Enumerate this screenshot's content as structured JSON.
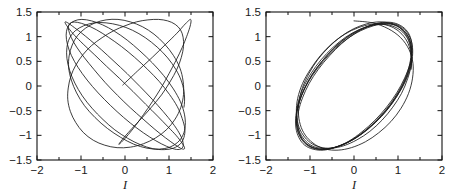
{
  "figure": {
    "background_color": "#ffffff",
    "curve_color": "#1a1a1a",
    "axis_color": "#111111",
    "panel_count": 2
  },
  "chart_data": [
    {
      "type": "line",
      "title": "",
      "subtitle": "",
      "panel": "left",
      "xlabel": "I",
      "ylabel": "",
      "xlim": [
        -2,
        2
      ],
      "ylim": [
        -1.5,
        1.5
      ],
      "xticks": [
        -2,
        -1,
        0,
        1,
        2
      ],
      "xticklabels": [
        "-2",
        "-1",
        "0",
        "1",
        "2"
      ],
      "yticks": [
        -1.5,
        -1,
        -0.5,
        0,
        0.5,
        1,
        1.5
      ],
      "yticklabels": [
        "-1.5",
        "-1",
        "-0.5",
        "0",
        "0.5",
        "1",
        "1.5"
      ],
      "minor_xticks": [
        -1.5,
        -0.5,
        0.5,
        1.5
      ],
      "minor_yticks": [],
      "grid": false,
      "legend": null,
      "legend_position": "none",
      "annotations": [],
      "description": "Quasi-periodic trajectory: a broad right-hand lobe crossed by a narrow elongated pencil of near-straight strands running from lower-left cusp to upper-right, plus a thin ellipse across the top.",
      "series": [
        {
          "name": "trajectory",
          "x": [
            -0.05,
            0.28,
            0.62,
            0.93,
            1.18,
            1.34,
            1.44,
            1.49,
            1.5,
            1.47,
            1.4,
            1.3,
            1.16,
            1.0,
            0.82,
            0.62,
            0.42,
            0.24,
            0.08,
            -0.04,
            -0.12,
            -0.14,
            -0.1,
            0.0,
            0.16,
            0.37,
            0.6,
            0.83,
            1.02,
            1.18,
            1.28,
            1.33,
            1.32,
            1.26,
            1.14,
            0.97,
            0.76,
            0.52,
            0.26,
            0.0,
            -0.26,
            -0.52,
            -0.76,
            -0.96,
            -1.12,
            -1.23,
            -1.29,
            -1.3,
            -1.24,
            -1.12,
            -0.95,
            -0.72,
            -0.46,
            -0.18,
            0.12,
            0.42,
            0.7,
            0.95,
            1.14,
            1.27,
            1.33,
            1.32,
            1.25,
            1.1,
            0.9,
            0.66,
            0.4,
            0.12,
            -0.16,
            -0.43,
            -0.68,
            -0.9,
            -1.08,
            -1.2,
            -1.27,
            -1.28,
            -1.22,
            -1.1,
            -0.92,
            -0.68,
            -0.4,
            -0.1,
            0.2,
            0.5,
            0.78,
            1.02,
            1.2,
            1.32,
            1.37,
            1.35,
            1.26,
            1.1,
            0.88,
            0.62,
            0.34,
            0.05,
            -0.24,
            -0.51,
            -0.76,
            -0.98,
            -1.15,
            -1.27,
            -1.33,
            -1.33,
            -1.27,
            -1.15,
            -0.97,
            -0.74,
            -0.47,
            -0.18,
            0.12,
            0.42,
            0.7,
            0.94,
            1.13,
            1.26,
            1.32,
            1.31,
            1.23,
            1.08,
            0.87,
            0.62,
            0.34,
            0.05,
            -0.25,
            -0.53,
            -0.79,
            -1.01,
            -1.19,
            -1.3,
            -1.36,
            -1.35,
            -1.28,
            -1.15,
            -0.95,
            -0.7,
            -0.42,
            -0.12,
            0.18,
            0.47,
            0.74,
            0.98,
            1.17,
            1.29,
            1.35,
            1.34,
            1.26,
            1.12,
            0.92,
            0.68,
            0.41,
            0.12,
            -0.17,
            -0.45,
            -0.7,
            -0.92,
            -1.1,
            -1.22,
            -1.28,
            -1.28,
            -1.21,
            -1.08,
            -0.89,
            -0.65,
            -0.38,
            -0.08,
            0.22,
            0.51,
            0.78,
            1.01,
            1.19,
            1.3,
            1.36,
            1.34,
            1.26,
            1.1,
            0.89,
            0.63,
            0.35,
            0.06,
            -0.23,
            -0.5,
            -0.75,
            -0.97,
            -1.14,
            -1.26,
            -1.32,
            -1.32,
            -1.26,
            -1.13,
            -0.94,
            -0.7,
            -0.43,
            -0.13,
            0.17,
            0.46,
            0.73,
            0.97,
            1.16,
            1.29,
            1.35,
            1.34,
            1.26,
            1.12,
            0.91,
            0.66,
            0.38,
            0.09
          ],
          "y": [
            0.02,
            0.3,
            0.58,
            0.85,
            1.07,
            1.23,
            1.32,
            1.35,
            1.3,
            1.18,
            1.0,
            0.78,
            0.52,
            0.25,
            -0.04,
            -0.32,
            -0.58,
            -0.8,
            -0.98,
            -1.1,
            -1.17,
            -1.18,
            -1.13,
            -1.02,
            -0.86,
            -0.66,
            -0.43,
            -0.18,
            0.08,
            0.34,
            0.58,
            0.8,
            0.99,
            1.14,
            1.25,
            1.32,
            1.35,
            1.34,
            1.3,
            1.22,
            1.12,
            0.98,
            0.82,
            0.63,
            0.42,
            0.2,
            -0.04,
            -0.28,
            -0.52,
            -0.74,
            -0.94,
            -1.1,
            -1.2,
            -1.25,
            -1.24,
            -1.17,
            -1.05,
            -0.88,
            -0.67,
            -0.43,
            -0.17,
            0.1,
            0.36,
            0.62,
            0.85,
            1.05,
            1.2,
            1.3,
            1.35,
            1.34,
            1.28,
            1.17,
            1.02,
            0.83,
            0.61,
            0.37,
            0.12,
            -0.14,
            -0.4,
            -0.64,
            -0.86,
            -1.04,
            -1.18,
            -1.26,
            -1.28,
            -1.24,
            -1.14,
            -0.99,
            -0.8,
            -0.57,
            -0.32,
            -0.06,
            0.21,
            0.47,
            0.71,
            0.93,
            1.11,
            1.24,
            1.32,
            1.35,
            1.32,
            1.24,
            1.11,
            0.94,
            0.73,
            0.5,
            0.25,
            -0.01,
            -0.27,
            -0.52,
            -0.75,
            -0.95,
            -1.11,
            -1.22,
            -1.28,
            -1.28,
            -1.22,
            -1.11,
            -0.95,
            -0.75,
            -0.52,
            -0.27,
            -0.01,
            0.25,
            0.5,
            0.73,
            0.93,
            1.09,
            1.21,
            1.28,
            1.3,
            1.26,
            1.17,
            1.03,
            0.85,
            0.64,
            0.4,
            0.15,
            -0.11,
            -0.37,
            -0.61,
            -0.83,
            -1.01,
            -1.15,
            -1.24,
            -1.28,
            -1.26,
            -1.18,
            -1.05,
            -0.88,
            -0.67,
            -0.44,
            -0.19,
            0.07,
            0.33,
            0.57,
            0.79,
            0.98,
            1.13,
            1.23,
            1.29,
            1.29,
            1.24,
            1.14,
            0.99,
            0.8,
            0.58,
            0.34,
            0.09,
            -0.17,
            -0.42,
            -0.66,
            -0.87,
            -1.04,
            -1.17,
            -1.26,
            -1.29,
            -1.27,
            -1.19,
            -1.06,
            -0.89,
            -0.68,
            -0.45,
            -0.2,
            0.06,
            0.32,
            0.56,
            0.78,
            0.97,
            1.12,
            1.22,
            1.28,
            1.28,
            1.23,
            1.13,
            0.98,
            0.79,
            0.57,
            0.33,
            0.08,
            -0.18,
            -0.43,
            -0.66
          ]
        }
      ]
    },
    {
      "type": "line",
      "title": "",
      "subtitle": "",
      "panel": "right",
      "xlabel": "I",
      "ylabel": "",
      "xlim": [
        -2,
        2
      ],
      "ylim": [
        -1.5,
        1.5
      ],
      "xticks": [
        -2,
        -1,
        0,
        1,
        2
      ],
      "xticklabels": [
        "-2",
        "-1",
        "0",
        "1",
        "2"
      ],
      "yticks": [
        -1.5,
        -1,
        -0.5,
        0,
        0.5,
        1,
        1.5
      ],
      "yticklabels": [
        "-1.5",
        "-1",
        "-0.5",
        "0",
        "0.5",
        "1",
        "1.5"
      ],
      "minor_xticks": [
        -1.5,
        -0.5,
        0.5,
        1.5
      ],
      "minor_yticks": [],
      "grid": false,
      "legend": null,
      "legend_position": "none",
      "annotations": [],
      "description": "Quasi-periodic trajectory forming a bundle of nested near-circular loops of radius about 1.3 centred near the origin, with a thin tilted ellipse overlaying the upper-left region and strands converging near (0, 1.35).",
      "series": [
        {
          "name": "trajectory",
          "x": [
            0.0,
            0.42,
            0.78,
            1.06,
            1.25,
            1.34,
            1.33,
            1.24,
            1.07,
            0.84,
            0.56,
            0.26,
            -0.06,
            -0.36,
            -0.64,
            -0.88,
            -1.07,
            -1.2,
            -1.26,
            -1.25,
            -1.17,
            -1.02,
            -0.82,
            -0.57,
            -0.3,
            -0.01,
            0.29,
            0.57,
            0.83,
            1.04,
            1.19,
            1.28,
            1.29,
            1.23,
            1.1,
            0.91,
            0.67,
            0.4,
            0.11,
            -0.19,
            -0.47,
            -0.73,
            -0.95,
            -1.12,
            -1.23,
            -1.28,
            -1.26,
            -1.17,
            -1.02,
            -0.81,
            -0.56,
            -0.28,
            0.01,
            0.3,
            0.58,
            0.84,
            1.05,
            1.21,
            1.3,
            1.32,
            1.27,
            1.15,
            0.97,
            0.74,
            0.47,
            0.18,
            -0.12,
            -0.42,
            -0.69,
            -0.93,
            -1.12,
            -1.25,
            -1.32,
            -1.32,
            -1.25,
            -1.12,
            -0.93,
            -0.69,
            -0.42,
            -0.13,
            0.17,
            0.46,
            0.73,
            0.96,
            1.14,
            1.26,
            1.31,
            1.29,
            1.2,
            1.04,
            0.83,
            0.57,
            0.29,
            -0.01,
            -0.31,
            -0.59,
            -0.84,
            -1.05,
            -1.2,
            -1.29,
            -1.31,
            -1.26,
            -1.14,
            -0.96,
            -0.73,
            -0.47,
            -0.18,
            0.12,
            0.42,
            0.7,
            0.95,
            1.14,
            1.27,
            1.33,
            1.32,
            1.24,
            1.09,
            0.88,
            0.63,
            0.34,
            0.04,
            -0.26,
            -0.55,
            -0.8,
            -1.02,
            -1.18,
            -1.28,
            -1.31,
            -1.26,
            -1.14,
            -0.95,
            -0.71,
            -0.44,
            -0.15,
            0.15,
            0.44,
            0.71,
            0.94,
            1.12,
            1.25,
            1.31,
            1.3,
            1.22,
            1.07,
            0.87,
            0.62,
            0.34,
            0.05,
            -0.25,
            -0.53,
            -0.78,
            -1.0,
            -1.16,
            -1.27,
            -1.31,
            -1.27,
            -1.16,
            -0.98,
            -0.75,
            -0.48,
            -0.19,
            0.11,
            0.41,
            0.68,
            0.92,
            1.11,
            1.24,
            1.3,
            1.3,
            1.22,
            1.08,
            0.88,
            0.64,
            0.36,
            0.07,
            -0.23,
            -0.51,
            -0.77,
            -0.99,
            -1.16,
            -1.27,
            -1.31,
            -1.28,
            -1.17,
            -0.99,
            -0.76,
            -0.5,
            -0.21,
            0.09,
            0.39,
            0.66,
            0.9,
            1.09,
            1.23,
            1.3,
            1.3,
            1.23,
            1.09,
            0.9,
            0.66,
            0.39,
            0.09
          ],
          "y": [
            1.32,
            1.28,
            1.16,
            0.98,
            0.74,
            0.46,
            0.16,
            -0.15,
            -0.45,
            -0.72,
            -0.95,
            -1.13,
            -1.25,
            -1.3,
            -1.28,
            -1.19,
            -1.04,
            -0.84,
            -0.59,
            -0.32,
            -0.03,
            0.26,
            0.54,
            0.79,
            1.0,
            1.16,
            1.26,
            1.3,
            1.27,
            1.18,
            1.03,
            0.83,
            0.58,
            0.32,
            0.03,
            -0.26,
            -0.54,
            -0.79,
            -1.0,
            -1.16,
            -1.25,
            -1.28,
            -1.24,
            -1.14,
            -0.97,
            -0.76,
            -0.51,
            -0.24,
            0.05,
            0.34,
            0.61,
            0.86,
            1.06,
            1.2,
            1.28,
            1.29,
            1.23,
            1.11,
            0.93,
            0.7,
            0.44,
            0.16,
            -0.14,
            -0.43,
            -0.7,
            -0.93,
            -1.12,
            -1.24,
            -1.3,
            -1.28,
            -1.2,
            -1.05,
            -0.85,
            -0.6,
            -0.33,
            -0.04,
            0.26,
            0.54,
            0.79,
            1.0,
            1.15,
            1.24,
            1.27,
            1.23,
            1.12,
            0.95,
            0.73,
            0.48,
            0.2,
            -0.09,
            -0.38,
            -0.65,
            -0.89,
            -1.08,
            -1.21,
            -1.28,
            -1.28,
            -1.21,
            -1.07,
            -0.88,
            -0.64,
            -0.37,
            -0.08,
            0.22,
            0.5,
            0.76,
            0.98,
            1.14,
            1.24,
            1.28,
            1.25,
            1.15,
            0.99,
            0.78,
            0.53,
            0.25,
            -0.04,
            -0.33,
            -0.61,
            -0.85,
            -1.05,
            -1.19,
            -1.27,
            -1.28,
            -1.21,
            -1.08,
            -0.89,
            -0.65,
            -0.38,
            -0.09,
            0.21,
            0.49,
            0.75,
            0.96,
            1.12,
            1.22,
            1.26,
            1.23,
            1.13,
            0.97,
            0.76,
            0.51,
            0.24,
            -0.06,
            -0.35,
            -0.62,
            -0.86,
            -1.05,
            -1.19,
            -1.26,
            -1.26,
            -1.19,
            -1.05,
            -0.86,
            -0.62,
            -0.34,
            -0.05,
            0.25,
            0.53,
            0.78,
            0.99,
            1.14,
            1.23,
            1.25,
            1.2,
            1.09,
            0.92,
            0.69,
            0.43,
            0.15,
            -0.15,
            -0.43,
            -0.69,
            -0.92,
            -1.09,
            -1.21,
            -1.26,
            -1.24,
            -1.15,
            -0.99,
            -0.78,
            -0.53,
            -0.25,
            0.05,
            0.34,
            0.62,
            0.86,
            1.05,
            1.18,
            1.25,
            1.25,
            1.18,
            1.05,
            0.86,
            0.62,
            0.34,
            0.05
          ]
        }
      ]
    }
  ]
}
